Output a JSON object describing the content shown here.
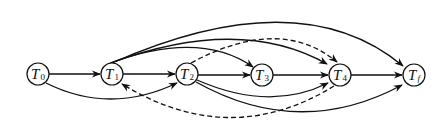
{
  "diagram": {
    "type": "directed-graph",
    "nodes": [
      {
        "id": "T0",
        "base": "T",
        "sub": "0",
        "x": 38,
        "y": 74
      },
      {
        "id": "T1",
        "base": "T",
        "sub": "1",
        "x": 112,
        "y": 74
      },
      {
        "id": "T2",
        "base": "T",
        "sub": "2",
        "x": 187,
        "y": 74
      },
      {
        "id": "T3",
        "base": "T",
        "sub": "3",
        "x": 262,
        "y": 75
      },
      {
        "id": "T4",
        "base": "T",
        "sub": "4",
        "x": 340,
        "y": 75
      },
      {
        "id": "Tf",
        "base": "T",
        "sub": "f",
        "x": 414,
        "y": 75
      }
    ],
    "edges": [
      {
        "from": "T0",
        "to": "T1",
        "style": "solid"
      },
      {
        "from": "T0",
        "to": "T2",
        "style": "solid"
      },
      {
        "from": "T1",
        "to": "T2",
        "style": "solid"
      },
      {
        "from": "T1",
        "to": "T3",
        "style": "solid"
      },
      {
        "from": "T1",
        "to": "T4",
        "style": "solid"
      },
      {
        "from": "T1",
        "to": "Tf",
        "style": "solid"
      },
      {
        "from": "T2",
        "to": "T3",
        "style": "solid"
      },
      {
        "from": "T2",
        "to": "T4",
        "style": "solid"
      },
      {
        "from": "T2",
        "to": "Tf",
        "style": "solid"
      },
      {
        "from": "T2",
        "to": "T4",
        "style": "dashed"
      },
      {
        "from": "T4",
        "to": "T1",
        "style": "dashed"
      },
      {
        "from": "T3",
        "to": "T4",
        "style": "solid"
      },
      {
        "from": "T4",
        "to": "Tf",
        "style": "solid"
      }
    ]
  }
}
